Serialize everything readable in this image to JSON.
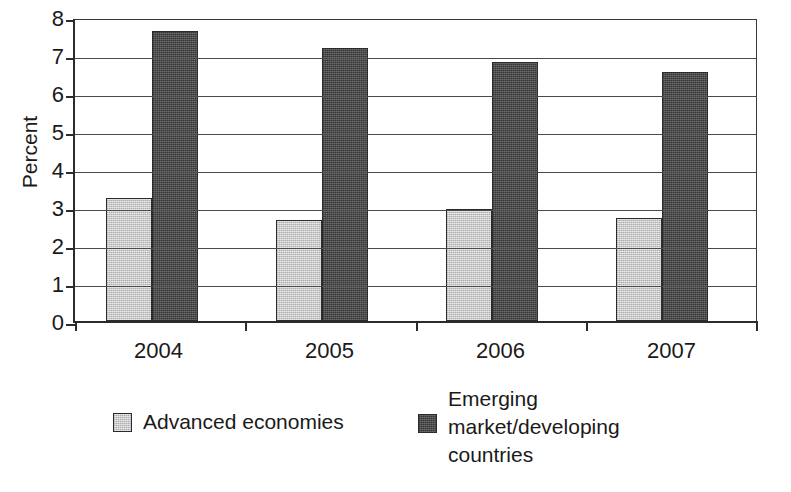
{
  "chart_data": {
    "type": "bar",
    "title": "",
    "xlabel": "",
    "ylabel": "Percent",
    "categories": [
      "2004",
      "2005",
      "2006",
      "2007"
    ],
    "series": [
      {
        "name": "Advanced economies",
        "values": [
          3.25,
          2.65,
          2.95,
          2.7
        ],
        "color": "#c9c9c9"
      },
      {
        "name": "Emerging market/developing countries",
        "values": [
          7.63,
          7.18,
          6.82,
          6.55
        ],
        "color": "#4d4d4d"
      }
    ],
    "ylim": [
      0,
      8
    ],
    "yticks": [
      0,
      1,
      2,
      3,
      4,
      5,
      6,
      7,
      8
    ],
    "ytick_labels": [
      "0",
      "1",
      "2",
      "3",
      "4",
      "5",
      "6",
      "7",
      "8"
    ],
    "grid": "horizontal",
    "legend_position": "bottom"
  },
  "axis": {
    "y_title": "Percent",
    "y_ticks": [
      "8",
      "7",
      "6",
      "5",
      "4",
      "3",
      "2",
      "1",
      "0"
    ],
    "x_ticks": [
      "2004",
      "2005",
      "2006",
      "2007"
    ]
  },
  "legend": {
    "entries": [
      {
        "label": "Advanced economies",
        "swatch": "light-gray-swatch"
      },
      {
        "label": "Emerging\nmarket/developing\ncountries",
        "swatch": "dark-gray-swatch"
      }
    ]
  },
  "colors": {
    "series_light": "#c9c9c9",
    "series_dark": "#4d4d4d",
    "axis": "#2b2b2b",
    "grid": "#4a4a4a",
    "background": "#ffffff",
    "text": "#1a1a1a"
  }
}
